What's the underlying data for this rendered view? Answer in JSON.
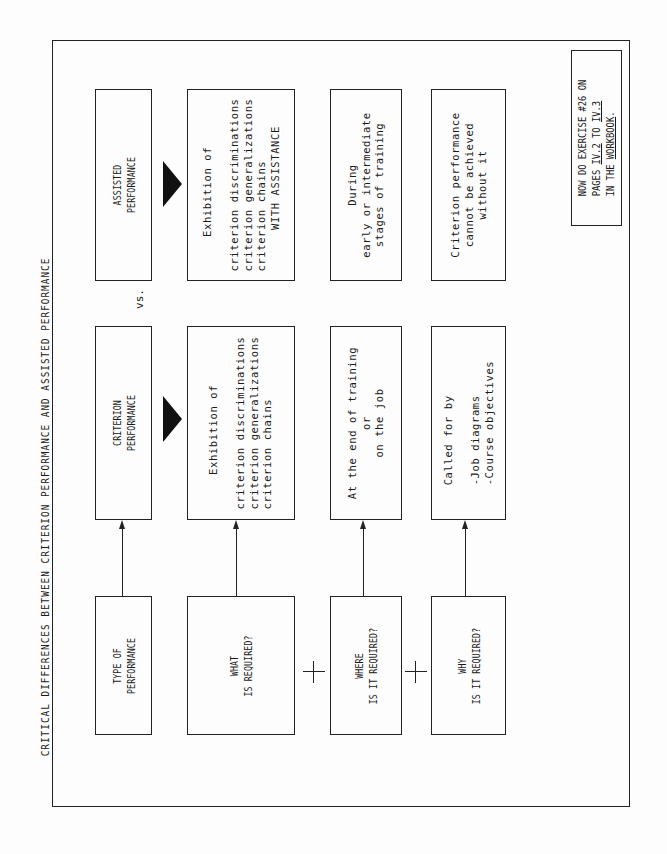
{
  "title": "CRITICAL DIFFERENCES BETWEEN CRITERION PERFORMANCE AND ASSISTED PERFORMANCE",
  "vs_label": "vs.",
  "rows": {
    "type": {
      "question": "TYPE OF\nPERFORMANCE",
      "criterion": "CRITERION\nPERFORMANCE",
      "assisted": "ASSISTED\nPERFORMANCE"
    },
    "what": {
      "question": "WHAT\nIS REQUIRED?",
      "criterion": "     Exhibition of\n\ncriterion discriminations\ncriterion generalizations\ncriterion chains",
      "assisted": "     Exhibition of\n\ncriterion discriminations\ncriterion generalizations\ncriterion chains\n      WITH ASSISTANCE"
    },
    "where": {
      "question": "WHERE\nIS IT REQUIRED?",
      "criterion": "At the end of training\nor\non the job",
      "assisted": "During\nearly or intermediate\nstages of training"
    },
    "why": {
      "question": "WHY\nIS IT REQUIRED?",
      "criterion": "Called for by\n\n-Job diagrams\n-Course objectives",
      "assisted": "Criterion performance\ncannot be achieved\nwithout it"
    }
  },
  "note": {
    "line1": "NOW DO EXERCISE #26 ON",
    "line2_prefix": "PAGES ",
    "line2_link1": "IV.2",
    "line2_mid": " TO ",
    "line2_link2": "IV.3",
    "line3_prefix": "IN THE ",
    "line3_link": "WORKBOOK",
    "line3_suffix": "."
  },
  "connectors": {
    "plus_symbol": "+",
    "arrow_direction": "question-to-criterion"
  }
}
